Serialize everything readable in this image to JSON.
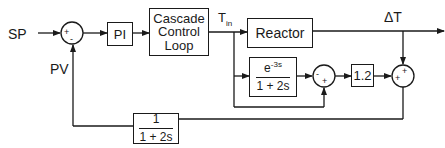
{
  "diagram": {
    "type": "control-block-diagram",
    "inputs": {
      "setpoint": "SP",
      "process_variable": "PV"
    },
    "blocks": {
      "controller": "PI",
      "cascade": [
        "Cascade",
        "Control",
        "Loop"
      ],
      "reactor": "Reactor",
      "model": {
        "numerator_base": "e",
        "numerator_exp": "-3s",
        "denominator": "1 + 2s"
      },
      "gain": "1.2",
      "filter": {
        "numerator": "1",
        "denominator": "1 + 2s"
      }
    },
    "signals": {
      "inlet_temp_base": "T",
      "inlet_temp_sub": "in",
      "output": "ΔT"
    },
    "junctions": {
      "sum1": {
        "left": "+",
        "bottom": "-"
      },
      "sum2": {
        "left": "-",
        "bottom": "+"
      },
      "sum3": {
        "top": "+",
        "left": "+"
      }
    },
    "colors": {
      "line": "#1a1a1a",
      "background": "#ffffff"
    }
  }
}
